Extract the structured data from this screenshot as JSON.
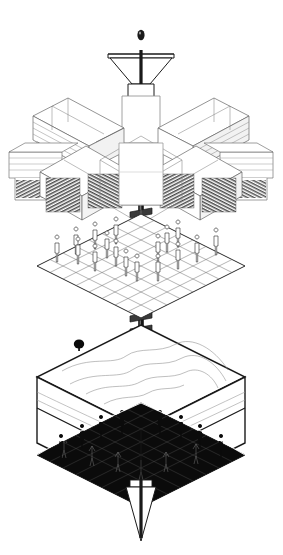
{
  "diagram": {
    "type": "exploded-axonometric-wireframe",
    "background_color": "#ffffff",
    "line_color": "#1a1a1a",
    "light_line_color": "#8a8a8a",
    "fill_white": "#ffffff",
    "fill_dark": "#0b0b0b",
    "fill_shade": "#6f6f6f",
    "projection": {
      "kind": "isometric",
      "plane_half_width": 104,
      "plane_half_depth": 52,
      "center_x": 141
    },
    "layers": [
      {
        "id": "screw-head",
        "name": "Countersunk screw head with driver slot",
        "center_y": 50,
        "head_half_width": 33,
        "head_height": 8,
        "cone_height": 16
      },
      {
        "id": "detached-dot",
        "name": "Detached screw-head cap",
        "center_y": 35,
        "width": 7,
        "height": 10
      },
      {
        "id": "buildings",
        "name": "Cruciform modular building cluster",
        "center_y": 139,
        "arms": 4,
        "arm_labels": [
          "north-west-arm",
          "north-east-arm",
          "south-west-arm",
          "south-east-arm"
        ]
      },
      {
        "id": "core-box",
        "name": "Central white circulation core",
        "center_y": 172,
        "width": 44,
        "height": 62
      },
      {
        "id": "people-plane",
        "name": "Public ground plane with standing figures",
        "center_y": 266,
        "figure_count": 17,
        "grid_divisions": 8
      },
      {
        "id": "terrain-block",
        "name": "Stratified earth / terrain block with tree",
        "center_y": 362,
        "block_depth": 66,
        "strata": 3,
        "tree_count": 1
      },
      {
        "id": "mirror-plane",
        "name": "Inverted dark reflection plane with silhouette figures",
        "center_y": 455,
        "figure_count": 11
      },
      {
        "id": "screw-tip",
        "name": "Screw point / tip",
        "center_y": 515,
        "tip_height": 34
      }
    ]
  }
}
